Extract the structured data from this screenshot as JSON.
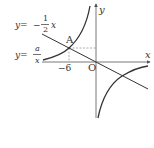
{
  "diagram": {
    "type": "coordinate-graph",
    "axes": {
      "x_label": "x",
      "y_label": "y",
      "origin_label": "O"
    },
    "curves": {
      "line": {
        "label_lhs": "y=",
        "label_sign": "−",
        "label_num": "1",
        "label_den": "2",
        "label_var": "x",
        "equation": "y = -1/2 x"
      },
      "hyperbola": {
        "label_lhs": "y=",
        "label_num": "a",
        "label_den": "x",
        "equation": "y = a/x"
      }
    },
    "points": {
      "intersection": {
        "label": "A",
        "x_value_label": "−6"
      }
    },
    "colors": {
      "curve": "#333333",
      "axis": "#555555",
      "dashed": "#999999",
      "text": "#333333"
    }
  }
}
